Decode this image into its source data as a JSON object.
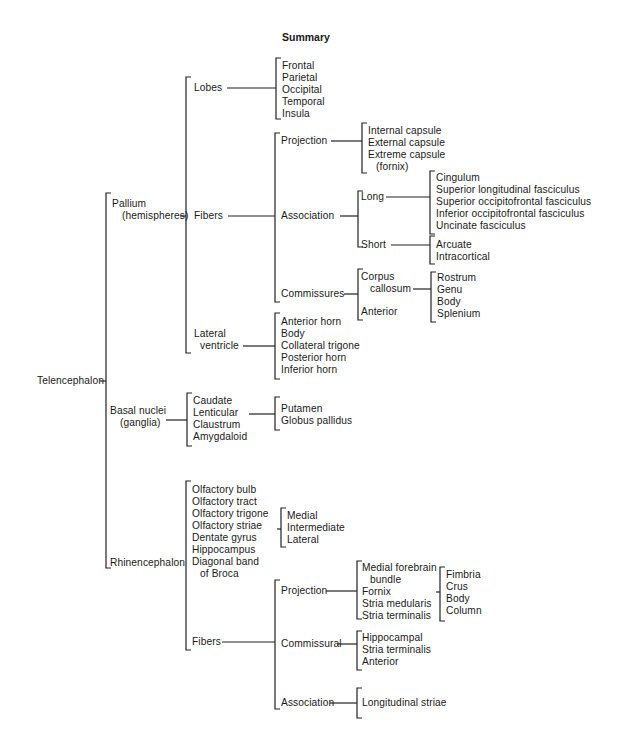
{
  "title": "Summary",
  "root": "Telencephalon",
  "pallium": {
    "label_line1": "Pallium",
    "label_line2": "(hemispheres)",
    "lobes": {
      "label": "Lobes",
      "items": [
        "Frontal",
        "Parietal",
        "Occipital",
        "Temporal",
        "Insula"
      ]
    },
    "fibers": {
      "label": "Fibers",
      "projection": {
        "label": "Projection",
        "items": [
          "Internal capsule",
          "External capsule",
          "Extreme capsule",
          "(fornix)"
        ]
      },
      "association": {
        "label": "Association",
        "long": {
          "label": "Long",
          "items": [
            "Cingulum",
            "Superior longitudinal fasciculus",
            "Superior occipitofrontal fasciculus",
            "Inferior occipitofrontal fasciculus",
            "Uncinate fasciculus"
          ]
        },
        "short": {
          "label": "Short",
          "items": [
            "Arcuate",
            "Intracortical"
          ]
        }
      },
      "commissures": {
        "label": "Commissures",
        "corpus_callosum": {
          "label_line1": "Corpus",
          "label_line2": "callosum",
          "items": [
            "Rostrum",
            "Genu",
            "Body",
            "Splenium"
          ]
        },
        "anterior": "Anterior"
      }
    },
    "lateral_ventricle": {
      "label_line1": "Lateral",
      "label_line2": "ventricle",
      "items": [
        "Anterior horn",
        "Body",
        "Collateral trigone",
        "Posterior horn",
        "Inferior horn"
      ]
    }
  },
  "basal_nuclei": {
    "label_line1": "Basal nuclei",
    "label_line2": "(ganglia)",
    "items": [
      "Caudate",
      "Lenticular",
      "Claustrum",
      "Amygdaloid"
    ],
    "lenticular_parts": [
      "Putamen",
      "Globus pallidus"
    ]
  },
  "rhinencephalon": {
    "label": "Rhinencephalon",
    "items": [
      "Olfactory bulb",
      "Olfactory tract",
      "Olfactory trigone",
      "Olfactory striae",
      "Dentate gyrus",
      "Hippocampus",
      "Diagonal band",
      "of Broca"
    ],
    "striae_parts": [
      "Medial",
      "Intermediate",
      "Lateral"
    ],
    "fibers": {
      "label": "Fibers",
      "projection": {
        "label": "Projection",
        "items": [
          "Medial forebrain",
          "bundle",
          "Fornix",
          "Stria medularis",
          "Stria terminalis"
        ],
        "fornix_parts": [
          "Fimbria",
          "Crus",
          "Body",
          "Column"
        ]
      },
      "commissural": {
        "label": "Commissural",
        "items": [
          "Hippocampal",
          "Stria terminalis",
          "Anterior"
        ]
      },
      "association": {
        "label": "Association",
        "items": [
          "Longitudinal striae"
        ]
      }
    }
  }
}
